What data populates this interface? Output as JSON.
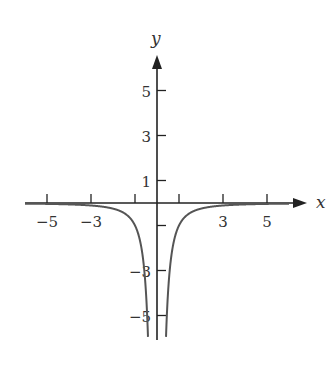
{
  "chart_data": {
    "type": "line",
    "title": "",
    "xlabel": "x",
    "ylabel": "y",
    "function": "y = -1/x^2",
    "xlim": [
      -6.0,
      6.8
    ],
    "ylim": [
      -6.0,
      6.5
    ],
    "x_ticks": [
      -5,
      -3,
      -1,
      1,
      3,
      5
    ],
    "x_tick_labels": [
      "-5",
      "-3",
      "",
      "",
      "3",
      "5"
    ],
    "y_ticks": [
      5,
      3,
      1,
      -1,
      -3,
      -5
    ],
    "y_tick_labels": [
      "5",
      "3",
      "1",
      "",
      "-3",
      "-5"
    ],
    "grid": false,
    "legend": null,
    "series": [
      {
        "name": "left branch",
        "x": [
          -6,
          -5,
          -4,
          -3,
          -2,
          -1.5,
          -1,
          -0.8,
          -0.6,
          -0.5,
          -0.45,
          -0.42
        ],
        "y": [
          -0.03,
          -0.04,
          -0.06,
          -0.11,
          -0.25,
          -0.44,
          -1,
          -1.56,
          -2.78,
          -4,
          -4.94,
          -5.67
        ]
      },
      {
        "name": "right branch",
        "x": [
          0.42,
          0.45,
          0.5,
          0.6,
          0.8,
          1,
          1.5,
          2,
          3,
          4,
          5,
          6
        ],
        "y": [
          -5.67,
          -4.94,
          -4,
          -2.78,
          -1.56,
          -1,
          -0.44,
          -0.25,
          -0.11,
          -0.06,
          -0.04,
          -0.03
        ]
      }
    ],
    "asymptotes": {
      "vertical": 0,
      "horizontal": 0
    },
    "colors": {
      "axis": "#222222",
      "curve": "#555555"
    }
  }
}
